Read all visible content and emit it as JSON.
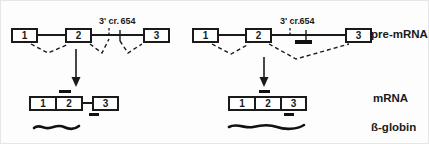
{
  "colors": {
    "ink": "#1a1a1a",
    "paper": "#fdfdfd",
    "oligo_bar": "#111111"
  },
  "row_labels": {
    "pre_mrna": "pre-mRNA",
    "mrna": "mRNA",
    "beta_globin": "ß-globin"
  },
  "left_panel": {
    "pre_mrna": {
      "exon1": "1",
      "exon2": "2",
      "exon3": "3",
      "cryptic_site": "3' cr.",
      "mutation_site": "654"
    },
    "mrna": {
      "exon1": "1",
      "exon2": "2",
      "exon3": "3"
    }
  },
  "right_panel": {
    "pre_mrna": {
      "exon1": "1",
      "exon2": "2",
      "exon3": "3",
      "cryptic_site": "3' cr.",
      "mutation_site": "654"
    },
    "mrna": {
      "exon1": "1",
      "exon2": "2",
      "exon3": "3"
    }
  }
}
